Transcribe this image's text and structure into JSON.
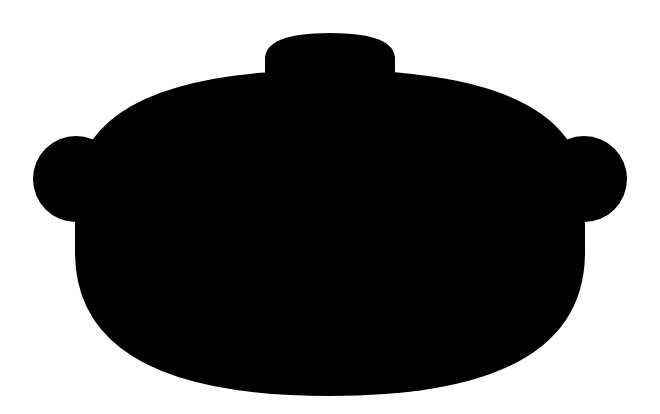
{
  "canvas": {
    "width": 660,
    "height": 414,
    "background_color": "#ffffff",
    "title": "Cooking Pot Silhouette"
  },
  "artwork": {
    "name": "cooking-pot-silhouette",
    "subject": "covered cooking pot / casserole dish",
    "style": "solid black silhouette on white",
    "fill_color": "#000000",
    "stroke_color": "none",
    "orientation": "front view, symmetric about vertical centerline",
    "symmetry_axis_x": 330
  },
  "parts": [
    {
      "id": "lid-knob",
      "label": "Lid knob",
      "shape": "rounded-dome",
      "bounds": {
        "x": 265,
        "y": 33,
        "width": 130,
        "height": 45
      },
      "center_x": 330,
      "top_y": 33,
      "corner_radius": 26
    },
    {
      "id": "lid-dome",
      "label": "Lid dome",
      "shape": "wide-dome",
      "bounds": {
        "x": 75,
        "y": 70,
        "width": 510,
        "height": 158
      },
      "apex_y": 70,
      "left_x": 75,
      "right_x": 585
    },
    {
      "id": "handle-left",
      "label": "Left handle",
      "shape": "circle",
      "center": {
        "x": 76,
        "y": 179
      },
      "radius": 43,
      "bounds": {
        "x": 33,
        "y": 136,
        "width": 86,
        "height": 86
      }
    },
    {
      "id": "handle-right",
      "label": "Right handle",
      "shape": "circle",
      "center": {
        "x": 584,
        "y": 179
      },
      "radius": 43,
      "bounds": {
        "x": 541,
        "y": 136,
        "width": 86,
        "height": 86
      }
    },
    {
      "id": "pot-body",
      "label": "Pot body",
      "shape": "rounded-bowl",
      "bounds": {
        "x": 75,
        "y": 180,
        "width": 510,
        "height": 216
      },
      "bottom_y": 396,
      "left_x": 75,
      "right_x": 585
    }
  ],
  "paths": {
    "knob": "M 265 78 L 265 60 Q 265 33 330 33 Q 395 33 395 60 L 395 78 Z",
    "lid": "M 75 228 L 75 196 Q 75 70 330 70 Q 585 70 585 196 L 585 228 Z",
    "body": "M 75 180 L 585 180 L 585 250 Q 585 396 330 396 Q 75 396 75 250 Z",
    "handle_left": "M 76 136 m -43 43 a 43 43 0 1 0 86 0 a 43 43 0 1 0 -86 0",
    "handle_right": "M 584 136 m -43 43 a 43 43 0 1 0 86 0 a 43 43 0 1 0 -86 0"
  }
}
